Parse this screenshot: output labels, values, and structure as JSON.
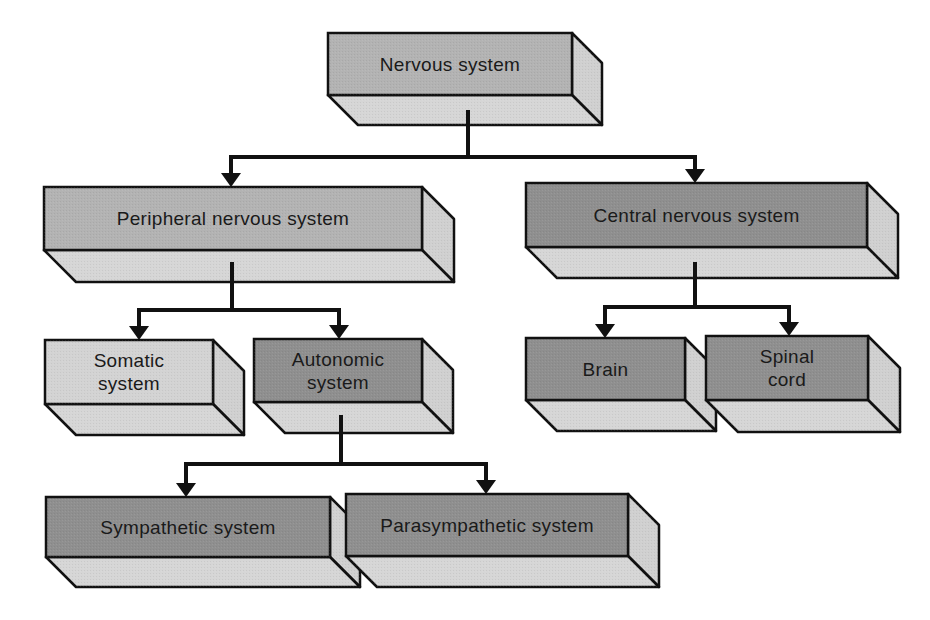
{
  "diagram": {
    "type": "hierarchy",
    "title": "Nervous system",
    "colors": {
      "front_dark": "#8f8f8f",
      "front_mid": "#b3b3b3",
      "front_light": "#d3d3d3",
      "bottom_face": "#d6d6d6",
      "side_face": "#d0d0d0",
      "outline": "#111111",
      "connector": "#111111"
    },
    "nodes": [
      {
        "id": "nervous",
        "label": "Nervous system",
        "shade": "mid",
        "x": 328,
        "y": 33,
        "w": 244,
        "h": 62,
        "depth": 30,
        "parent": null
      },
      {
        "id": "peripheral",
        "label": "Peripheral nervous system",
        "shade": "mid",
        "x": 44,
        "y": 187,
        "w": 378,
        "h": 63,
        "depth": 32,
        "parent": "nervous"
      },
      {
        "id": "central",
        "label": "Central nervous system",
        "shade": "dark",
        "x": 526,
        "y": 183,
        "w": 341,
        "h": 64,
        "depth": 31,
        "parent": "nervous"
      },
      {
        "id": "somatic",
        "label": "Somatic system",
        "shade": "light",
        "x": 45,
        "y": 340,
        "w": 168,
        "h": 64,
        "depth": 31,
        "parent": "peripheral"
      },
      {
        "id": "autonomic",
        "label": "Autonomic system",
        "shade": "dark",
        "x": 254,
        "y": 339,
        "w": 168,
        "h": 63,
        "depth": 31,
        "parent": "peripheral"
      },
      {
        "id": "brain",
        "label": "Brain",
        "shade": "dark",
        "x": 526,
        "y": 338,
        "w": 159,
        "h": 62,
        "depth": 31,
        "parent": "central"
      },
      {
        "id": "spinal",
        "label": "Spinal cord",
        "shade": "dark",
        "x": 706,
        "y": 336,
        "w": 162,
        "h": 64,
        "depth": 32,
        "parent": "central"
      },
      {
        "id": "sympathetic",
        "label": "Sympathetic system",
        "shade": "dark",
        "x": 46,
        "y": 497,
        "w": 284,
        "h": 60,
        "depth": 30,
        "parent": "autonomic"
      },
      {
        "id": "parasympathetic",
        "label": "Parasympathetic system",
        "shade": "dark",
        "x": 346,
        "y": 494,
        "w": 282,
        "h": 62,
        "depth": 31,
        "parent": "autonomic"
      }
    ],
    "connectors": [
      {
        "from": "nervous",
        "stem_x": 468,
        "stem_top": 110,
        "bar_y": 157,
        "bar_x1": 231,
        "bar_x2": 695,
        "targets": [
          {
            "x": 231,
            "y": 187
          },
          {
            "x": 695,
            "y": 183
          }
        ]
      },
      {
        "from": "peripheral",
        "stem_x": 232,
        "stem_top": 262,
        "bar_y": 310,
        "bar_x1": 139,
        "bar_x2": 339,
        "targets": [
          {
            "x": 139,
            "y": 340
          },
          {
            "x": 339,
            "y": 339
          }
        ]
      },
      {
        "from": "central",
        "stem_x": 695,
        "stem_top": 262,
        "bar_y": 307,
        "bar_x1": 605,
        "bar_x2": 789,
        "targets": [
          {
            "x": 605,
            "y": 338
          },
          {
            "x": 789,
            "y": 336
          }
        ]
      },
      {
        "from": "autonomic",
        "stem_x": 341,
        "stem_top": 415,
        "bar_y": 464,
        "bar_x1": 186,
        "bar_x2": 486,
        "targets": [
          {
            "x": 186,
            "y": 497
          },
          {
            "x": 486,
            "y": 494
          }
        ]
      }
    ]
  }
}
